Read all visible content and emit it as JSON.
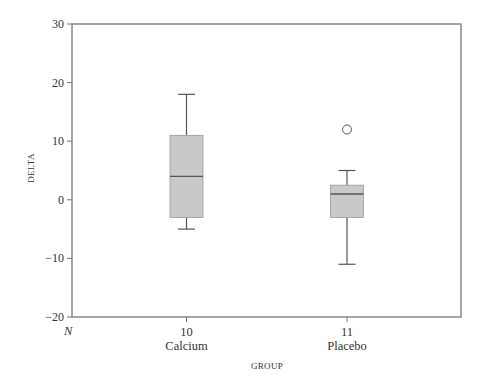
{
  "chart_data": {
    "type": "box",
    "title": "",
    "xlabel": "GROUP",
    "ylabel": "DELTA",
    "ylim": [
      -20,
      30
    ],
    "yticks": [
      -20,
      -10,
      0,
      10,
      20,
      30
    ],
    "n_label": "N",
    "grid": false,
    "legend": null,
    "categories": [
      "Calcium",
      "Placebo"
    ],
    "n": [
      10,
      11
    ],
    "boxes": [
      {
        "name": "Calcium",
        "n": 10,
        "whisker_low": -5,
        "q1": -3,
        "median": 4,
        "q3": 11,
        "whisker_high": 18,
        "outliers": []
      },
      {
        "name": "Placebo",
        "n": 11,
        "whisker_low": -11,
        "q1": -3,
        "median": 1,
        "q3": 2.5,
        "whisker_high": 5,
        "outliers": [
          12
        ]
      }
    ],
    "colors": {
      "box_fill": "#c9c9c9",
      "line": "#555555",
      "frame": "#777777"
    }
  }
}
